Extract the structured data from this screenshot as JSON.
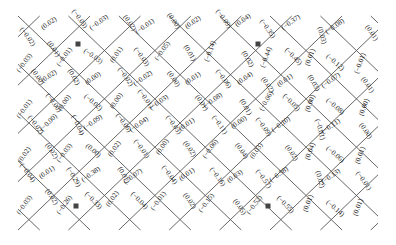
{
  "colors": {
    "line": "#555555",
    "text": "#222222",
    "background": "#ffffff"
  },
  "grid": {
    "cols": 7,
    "rows": 4,
    "origin": [
      30,
      30
    ],
    "dx": [
      48,
      -14
    ],
    "dy": [
      14,
      48
    ]
  },
  "markers": [
    {
      "col": 2,
      "row": 0
    },
    {
      "col": 5,
      "row": 0
    },
    {
      "col": 2,
      "row": 3
    },
    {
      "col": 5,
      "row": 3
    }
  ],
  "labels": [
    {
      "x": 26,
      "y": 38,
      "rot": 55,
      "text": "(−0.02)"
    },
    {
      "x": 50,
      "y": 25,
      "rot": -35,
      "text": "(0.02)"
    },
    {
      "x": 78,
      "y": 20,
      "rot": 55,
      "text": "(−0.03)"
    },
    {
      "x": 100,
      "y": 24,
      "rot": -35,
      "text": "(−0.03)"
    },
    {
      "x": 128,
      "y": 24,
      "rot": 55,
      "text": "(0.02)"
    },
    {
      "x": 146,
      "y": 28,
      "rot": -35,
      "text": "(−0.01)"
    },
    {
      "x": 172,
      "y": 22,
      "rot": 55,
      "text": "(0.00)"
    },
    {
      "x": 194,
      "y": 24,
      "rot": -35,
      "text": "(0.02)"
    },
    {
      "x": 222,
      "y": 20,
      "rot": 55,
      "text": "(−0.09)"
    },
    {
      "x": 244,
      "y": 22,
      "rot": -35,
      "text": "(0.04)"
    },
    {
      "x": 266,
      "y": 30,
      "rot": 55,
      "text": "(−0.35)"
    },
    {
      "x": 292,
      "y": 24,
      "rot": -35,
      "text": "(−0.37)"
    },
    {
      "x": 320,
      "y": 36,
      "rot": 75,
      "text": "(0.03)"
    },
    {
      "x": 336,
      "y": 28,
      "rot": -35,
      "text": "(−0.08)"
    },
    {
      "x": 370,
      "y": 34,
      "rot": 55,
      "text": "(0.01)"
    },
    {
      "x": 26,
      "y": 64,
      "rot": -55,
      "text": "(−0.03)"
    },
    {
      "x": 52,
      "y": 50,
      "rot": 55,
      "text": "(0.01)"
    },
    {
      "x": 66,
      "y": 58,
      "rot": -55,
      "text": "(−0.01)"
    },
    {
      "x": 92,
      "y": 58,
      "rot": 35,
      "text": "(−0.03)"
    },
    {
      "x": 118,
      "y": 56,
      "rot": -55,
      "text": "(0.01)"
    },
    {
      "x": 140,
      "y": 58,
      "rot": 55,
      "text": "(−0.03)"
    },
    {
      "x": 164,
      "y": 52,
      "rot": -55,
      "text": "(−0.05)"
    },
    {
      "x": 188,
      "y": 54,
      "rot": 60,
      "text": "(0.01)"
    },
    {
      "x": 212,
      "y": 52,
      "rot": -70,
      "text": "(−0.14)"
    },
    {
      "x": 246,
      "y": 60,
      "rot": 60,
      "text": "(0.02)"
    },
    {
      "x": 268,
      "y": 58,
      "rot": -70,
      "text": "(−0.44)"
    },
    {
      "x": 292,
      "y": 58,
      "rot": 45,
      "text": "(−0.45)"
    },
    {
      "x": 312,
      "y": 58,
      "rot": -70,
      "text": "(0.01)"
    },
    {
      "x": 334,
      "y": 64,
      "rot": 40,
      "text": "(−0.12)"
    },
    {
      "x": 362,
      "y": 64,
      "rot": -70,
      "text": "(−0.01)"
    },
    {
      "x": 36,
      "y": 78,
      "rot": 55,
      "text": "(0.00)"
    },
    {
      "x": 50,
      "y": 78,
      "rot": -35,
      "text": "(0.02)"
    },
    {
      "x": 72,
      "y": 78,
      "rot": 60,
      "text": "(0.02)"
    },
    {
      "x": 94,
      "y": 80,
      "rot": -35,
      "text": "(0.00)"
    },
    {
      "x": 124,
      "y": 78,
      "rot": 55,
      "text": "(−0.02)"
    },
    {
      "x": 144,
      "y": 80,
      "rot": -35,
      "text": "(−0.02)"
    },
    {
      "x": 172,
      "y": 80,
      "rot": 55,
      "text": "(0.00)"
    },
    {
      "x": 194,
      "y": 80,
      "rot": -35,
      "text": "(0.01)"
    },
    {
      "x": 222,
      "y": 80,
      "rot": 55,
      "text": "(−0.06)"
    },
    {
      "x": 246,
      "y": 80,
      "rot": -35,
      "text": "(0.04)"
    },
    {
      "x": 266,
      "y": 86,
      "rot": 55,
      "text": "(0.02)"
    },
    {
      "x": 286,
      "y": 82,
      "rot": -35,
      "text": "(0.01)"
    },
    {
      "x": 312,
      "y": 84,
      "rot": 60,
      "text": "(0.03)"
    },
    {
      "x": 332,
      "y": 82,
      "rot": -35,
      "text": "(−0.07)"
    },
    {
      "x": 366,
      "y": 86,
      "rot": 55,
      "text": "(0.01)"
    },
    {
      "x": 26,
      "y": 110,
      "rot": -55,
      "text": "(−0.01)"
    },
    {
      "x": 52,
      "y": 104,
      "rot": 55,
      "text": "(−0.00)"
    },
    {
      "x": 66,
      "y": 104,
      "rot": -55,
      "text": "(0.00)"
    },
    {
      "x": 92,
      "y": 104,
      "rot": 40,
      "text": "(−0.02)"
    },
    {
      "x": 118,
      "y": 102,
      "rot": -55,
      "text": "(0.00)"
    },
    {
      "x": 144,
      "y": 100,
      "rot": 55,
      "text": "(−0.01)"
    },
    {
      "x": 160,
      "y": 104,
      "rot": -35,
      "text": "(−0.03)"
    },
    {
      "x": 200,
      "y": 104,
      "rot": 55,
      "text": "(0.01)"
    },
    {
      "x": 214,
      "y": 102,
      "rot": -35,
      "text": "(−0.08)"
    },
    {
      "x": 244,
      "y": 108,
      "rot": 60,
      "text": "(0.01)"
    },
    {
      "x": 268,
      "y": 102,
      "rot": -60,
      "text": "(−0.06)"
    },
    {
      "x": 290,
      "y": 104,
      "rot": 45,
      "text": "(−0.05)"
    },
    {
      "x": 312,
      "y": 104,
      "rot": -70,
      "text": "(0.00)"
    },
    {
      "x": 334,
      "y": 108,
      "rot": 40,
      "text": "(−0.08)"
    },
    {
      "x": 366,
      "y": 108,
      "rot": -70,
      "text": "(0.00)"
    },
    {
      "x": 34,
      "y": 126,
      "rot": 55,
      "text": "(−0.02)"
    },
    {
      "x": 50,
      "y": 124,
      "rot": -45,
      "text": "(−0.00)"
    },
    {
      "x": 76,
      "y": 126,
      "rot": 65,
      "text": "(−0.04)"
    },
    {
      "x": 94,
      "y": 124,
      "rot": -35,
      "text": "(−0.09)"
    },
    {
      "x": 122,
      "y": 124,
      "rot": 55,
      "text": "(−0.06)"
    },
    {
      "x": 140,
      "y": 126,
      "rot": -35,
      "text": "(−0.04)"
    },
    {
      "x": 172,
      "y": 126,
      "rot": 55,
      "text": "(−0.03)"
    },
    {
      "x": 188,
      "y": 126,
      "rot": -35,
      "text": "(0.01)"
    },
    {
      "x": 218,
      "y": 126,
      "rot": 55,
      "text": "(−0.11)"
    },
    {
      "x": 240,
      "y": 124,
      "rot": -35,
      "text": "(0.00)"
    },
    {
      "x": 262,
      "y": 128,
      "rot": 55,
      "text": "(−0.09)"
    },
    {
      "x": 282,
      "y": 126,
      "rot": -35,
      "text": "(−0.10)"
    },
    {
      "x": 318,
      "y": 130,
      "rot": 75,
      "text": "(−0.01)"
    },
    {
      "x": 332,
      "y": 128,
      "rot": -35,
      "text": "(−0.11)"
    },
    {
      "x": 364,
      "y": 132,
      "rot": 55,
      "text": "(0.00)"
    },
    {
      "x": 26,
      "y": 156,
      "rot": -55,
      "text": "(0.02)"
    },
    {
      "x": 50,
      "y": 152,
      "rot": 55,
      "text": "(0.02)"
    },
    {
      "x": 66,
      "y": 154,
      "rot": -55,
      "text": "(−0.03)"
    },
    {
      "x": 92,
      "y": 152,
      "rot": 40,
      "text": "(0.00)"
    },
    {
      "x": 116,
      "y": 150,
      "rot": -55,
      "text": "(0.02)"
    },
    {
      "x": 140,
      "y": 150,
      "rot": 55,
      "text": "(−0.01)"
    },
    {
      "x": 164,
      "y": 148,
      "rot": -55,
      "text": "(0.00)"
    },
    {
      "x": 188,
      "y": 150,
      "rot": 55,
      "text": "(0.02)"
    },
    {
      "x": 212,
      "y": 150,
      "rot": -55,
      "text": "(−0.06)"
    },
    {
      "x": 240,
      "y": 152,
      "rot": 55,
      "text": "(0.04)"
    },
    {
      "x": 258,
      "y": 152,
      "rot": -55,
      "text": "(0.03)"
    },
    {
      "x": 290,
      "y": 154,
      "rot": 55,
      "text": "(0.02)"
    },
    {
      "x": 312,
      "y": 152,
      "rot": -70,
      "text": "(0.04)"
    },
    {
      "x": 334,
      "y": 156,
      "rot": 40,
      "text": "(−0.06)"
    },
    {
      "x": 362,
      "y": 156,
      "rot": -70,
      "text": "(0.01)"
    },
    {
      "x": 26,
      "y": 174,
      "rot": 55,
      "text": "(−0.04)"
    },
    {
      "x": 48,
      "y": 174,
      "rot": -35,
      "text": "(0.01)"
    },
    {
      "x": 72,
      "y": 178,
      "rot": 60,
      "text": "(−0.29)"
    },
    {
      "x": 92,
      "y": 176,
      "rot": -35,
      "text": "(−0.38)"
    },
    {
      "x": 122,
      "y": 176,
      "rot": 60,
      "text": "(0.01)"
    },
    {
      "x": 134,
      "y": 178,
      "rot": -35,
      "text": "(−0.07)"
    },
    {
      "x": 168,
      "y": 176,
      "rot": 55,
      "text": "(−0.04)"
    },
    {
      "x": 188,
      "y": 176,
      "rot": -35,
      "text": "(0.01)"
    },
    {
      "x": 216,
      "y": 178,
      "rot": 55,
      "text": "(−0.16)"
    },
    {
      "x": 236,
      "y": 178,
      "rot": -35,
      "text": "(0.03)"
    },
    {
      "x": 262,
      "y": 180,
      "rot": 55,
      "text": "(−0.57)"
    },
    {
      "x": 280,
      "y": 176,
      "rot": -35,
      "text": "(−0.58)"
    },
    {
      "x": 318,
      "y": 180,
      "rot": 75,
      "text": "(0.02)"
    },
    {
      "x": 332,
      "y": 178,
      "rot": -35,
      "text": "(−0.13)"
    },
    {
      "x": 362,
      "y": 182,
      "rot": 55,
      "text": "(−0.01)"
    },
    {
      "x": 26,
      "y": 206,
      "rot": -55,
      "text": "(−0.03)"
    },
    {
      "x": 50,
      "y": 198,
      "rot": 55,
      "text": "(0.02)"
    },
    {
      "x": 66,
      "y": 206,
      "rot": -55,
      "text": "(−0.26)"
    },
    {
      "x": 92,
      "y": 202,
      "rot": 45,
      "text": "(−0.33)"
    },
    {
      "x": 114,
      "y": 200,
      "rot": -55,
      "text": "(0.02)"
    },
    {
      "x": 138,
      "y": 202,
      "rot": 45,
      "text": "(−0.04)"
    },
    {
      "x": 160,
      "y": 202,
      "rot": -55,
      "text": "(−0.01)"
    },
    {
      "x": 188,
      "y": 202,
      "rot": 55,
      "text": "(0.02)"
    },
    {
      "x": 208,
      "y": 204,
      "rot": -55,
      "text": "(−0.15)"
    },
    {
      "x": 238,
      "y": 208,
      "rot": 55,
      "text": "(0.05)"
    },
    {
      "x": 256,
      "y": 206,
      "rot": -55,
      "text": "(−0.52)"
    },
    {
      "x": 284,
      "y": 206,
      "rot": 45,
      "text": "(−0.55)"
    },
    {
      "x": 310,
      "y": 204,
      "rot": -70,
      "text": "(0.01)"
    },
    {
      "x": 334,
      "y": 210,
      "rot": 40,
      "text": "(−0.14)"
    },
    {
      "x": 360,
      "y": 208,
      "rot": -70,
      "text": "(0.01)"
    }
  ]
}
